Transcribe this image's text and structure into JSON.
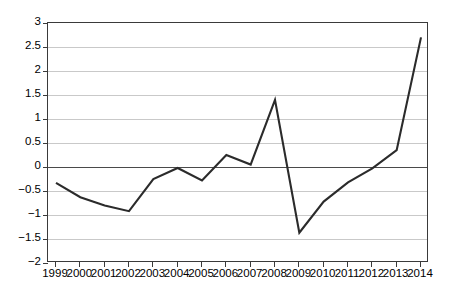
{
  "chart_data": {
    "type": "line",
    "title": "",
    "subtitle": "",
    "xlabel": "",
    "ylabel": "",
    "categories": [
      "1999",
      "2000",
      "2001",
      "2002",
      "2003",
      "2004",
      "2005",
      "2006",
      "2007",
      "2008",
      "2009",
      "2010",
      "2011",
      "2012",
      "2013",
      "2014"
    ],
    "values": [
      -0.33,
      -0.63,
      -0.8,
      -0.92,
      -0.25,
      -0.02,
      -0.28,
      0.25,
      0.05,
      1.4,
      -1.37,
      -0.72,
      -0.32,
      -0.03,
      0.35,
      2.7
    ],
    "series": [
      {
        "name": "",
        "values": [
          -0.33,
          -0.63,
          -0.8,
          -0.92,
          -0.25,
          -0.02,
          -0.28,
          0.25,
          0.05,
          1.4,
          -1.37,
          -0.72,
          -0.32,
          -0.03,
          0.35,
          2.7
        ]
      }
    ],
    "ylim": [
      -2,
      3
    ],
    "xlim": [
      "1999",
      "2014"
    ],
    "ytick_values": [
      3,
      2.5,
      2,
      1.5,
      1,
      0.5,
      0,
      -0.5,
      -1,
      -1.5,
      -2
    ],
    "ytick_labels": [
      "3",
      "2.5",
      "2",
      "1.5",
      "1",
      "0.5",
      "0",
      "−0.5",
      "−1",
      "−1.5",
      "−2"
    ],
    "xtick_labels": [
      "1999",
      "2000",
      "2001",
      "2002",
      "2003",
      "2004",
      "2005",
      "2006",
      "2007",
      "2008",
      "2009",
      "2010",
      "2011",
      "2012",
      "2013",
      "2014"
    ],
    "grid": true,
    "grid_axis": "y",
    "legend": false,
    "legend_position": "none",
    "annotations": [],
    "colors": {
      "line": "#2b2b2b",
      "gridline": "#c9c9c9",
      "zero_line": "#4a4a4a",
      "axis": "#3a3a3a",
      "background": "#ffffff",
      "text": "#000000"
    },
    "line_width": 2.1
  }
}
